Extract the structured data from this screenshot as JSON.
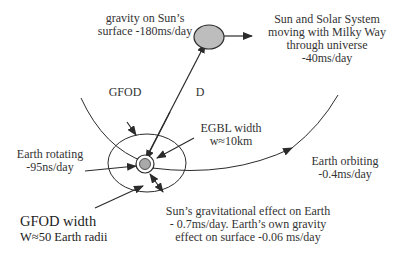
{
  "diagram": {
    "labels": {
      "sun_gravity": {
        "line1": "gravity on Sun’s",
        "line2": "surface -180ms/day"
      },
      "solar_system_motion": {
        "line1": "Sun and Solar System",
        "line2": "moving with Milky Way",
        "line3": "through universe",
        "line4": "-40ms/day"
      },
      "gfod": "GFOD",
      "distance": "D",
      "egbl_width": {
        "line1": "EGBL  width",
        "line2": "w≈10km"
      },
      "earth_rotating": {
        "line1": "Earth rotating",
        "line2": "-95ns/day"
      },
      "earth_orbiting": {
        "line1": "Earth orbiting",
        "line2": "-0.4ms/day"
      },
      "gfod_width": {
        "line1": "GFOD width",
        "line2": "W≈50 Earth radii"
      },
      "sun_effect": {
        "line1": "Sun’s gravitational effect on Earth",
        "line2": "- 0.7ms/day. Earth’s own gravity",
        "line3": "effect on surface -0.06 ms/day"
      }
    },
    "colors": {
      "line": "#2b2b2b",
      "sun_fill": "#bdbdbd",
      "earth_fill": "#a9a9a9",
      "background": "#ffffff"
    }
  }
}
